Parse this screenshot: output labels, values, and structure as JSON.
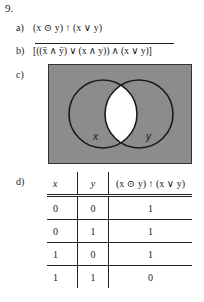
{
  "problem": {
    "number": "9.",
    "parts": {
      "a": {
        "label": "a)",
        "expression": "(x ⊙ y) ↑ (x ∨ y)"
      },
      "b": {
        "label": "b)",
        "expression": "[((x̄ ∧ ȳ) ∨ (x ∧ y)) ∧ (x ∨ y)]",
        "overlined": true
      },
      "c": {
        "label": "c)",
        "venn": {
          "circle_labels": [
            "x",
            "y"
          ],
          "shaded_color": "#8c8c8c",
          "unshaded_region": "intersection of x and y"
        }
      },
      "d": {
        "label": "d)",
        "truth_table": {
          "headers": [
            "x",
            "y",
            "(x ⊙ y) ↑ (x ∨ y)"
          ],
          "rows": [
            [
              "0",
              "0",
              "1"
            ],
            [
              "0",
              "1",
              "1"
            ],
            [
              "1",
              "0",
              "1"
            ],
            [
              "1",
              "1",
              "0"
            ]
          ]
        }
      }
    }
  }
}
